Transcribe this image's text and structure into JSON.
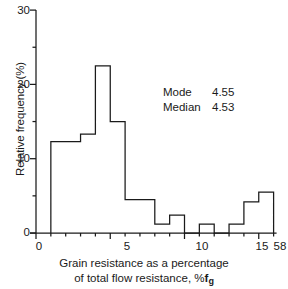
{
  "chart_data": {
    "type": "bar",
    "subtype": "histogram",
    "title": "",
    "xlabel": "Grain resistance as a percentage of total flow resistance, %fg",
    "xlabel_line1": "Grain resistance as a percentage",
    "xlabel_line2_prefix": "of total flow resistance, %",
    "xlabel_line2_symbol": "f",
    "xlabel_line2_subscript": "g",
    "ylabel": "Relative frequency (%)",
    "xlim": [
      0,
      16
    ],
    "ylim": [
      0,
      30
    ],
    "grid": false,
    "legend": false,
    "axis_break": true,
    "axis_break_note": "x axis is broken after 15; final bin extends to 58",
    "x_ticks": [
      0,
      5,
      10,
      15
    ],
    "x_tick_labels": [
      "0",
      "5",
      "10",
      "15"
    ],
    "x_break_tick_label": "58",
    "x_minor_tick_step": 1,
    "y_ticks": [
      0,
      10,
      20,
      30
    ],
    "y_tick_labels": [
      "0",
      "10",
      "20",
      "30"
    ],
    "y_minor_tick_step": 5,
    "line_color": "#1a1a1a",
    "fill": "none",
    "bins": [
      {
        "label": "1-3",
        "start": 1,
        "end": 3,
        "value": 12.3
      },
      {
        "label": "3-4",
        "start": 3,
        "end": 4,
        "value": 13.3
      },
      {
        "label": "4-5",
        "start": 4,
        "end": 5,
        "value": 22.5
      },
      {
        "label": "5-6",
        "start": 5,
        "end": 6,
        "value": 15.0
      },
      {
        "label": "6-8",
        "start": 6,
        "end": 8,
        "value": 4.5
      },
      {
        "label": "8-9",
        "start": 8,
        "end": 9,
        "value": 1.2
      },
      {
        "label": "9-10",
        "start": 9,
        "end": 10,
        "value": 2.4
      },
      {
        "label": "10-11",
        "start": 10,
        "end": 11,
        "value": 0.0
      },
      {
        "label": "11-12",
        "start": 11,
        "end": 12,
        "value": 1.2
      },
      {
        "label": "12-13",
        "start": 12,
        "end": 13,
        "value": 0.0
      },
      {
        "label": "13-14",
        "start": 13,
        "end": 14,
        "value": 1.2
      },
      {
        "label": "14-15",
        "start": 14,
        "end": 15,
        "value": 4.2
      },
      {
        "label": "15-58",
        "start": 15,
        "end": 16,
        "value": 5.5
      }
    ],
    "annotations": [
      {
        "name": "Mode",
        "value": "4.55"
      },
      {
        "name": "Median",
        "value": "4.53"
      }
    ]
  }
}
